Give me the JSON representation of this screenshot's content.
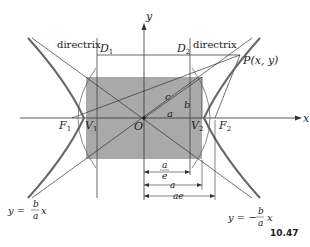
{
  "figure": {
    "number": "10.47",
    "axes": {
      "x_label": "x",
      "y_label": "y"
    },
    "labels": {
      "directrix_left": "directrix",
      "directrix_right": "directrix",
      "D1": "D",
      "D1_sub": "1",
      "D2": "D",
      "D2_sub": "2",
      "point": "P(x, y)",
      "F1": "F",
      "F1_sub": "1",
      "V1": "V",
      "V1_sub": "1",
      "O": "O",
      "V2": "V",
      "V2_sub": "2",
      "F2": "F",
      "F2_sub": "2",
      "a": "a",
      "b": "b",
      "c": "c"
    },
    "dimensions": {
      "a_over_e_num": "a",
      "a_over_e_den": "e",
      "a": "a",
      "ae": "ae"
    },
    "asymptotes": {
      "left_prefix": "y =",
      "left_num": "b",
      "left_den": "a",
      "left_suffix": "x",
      "right_prefix": "y = −",
      "right_num": "b",
      "right_den": "a",
      "right_suffix": "x"
    },
    "colors": {
      "rectangle_fill": "#a9a9a9",
      "curve": "#555555",
      "line": "#333333"
    }
  }
}
